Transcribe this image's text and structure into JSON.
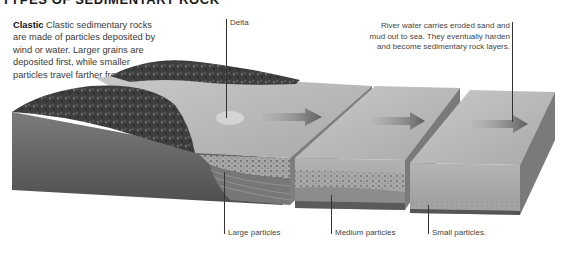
{
  "title": "TYPES OF SEDIMENTARY ROCK",
  "intro": {
    "heading": "Clastic",
    "text": "Clastic sedimentary rocks are made of particles deposited by wind or water. Larger grains are deposited first, while smaller particles travel farther from shore."
  },
  "callouts": {
    "delta": "Delta",
    "river_line1": "River water carries eroded sand and",
    "river_line2": "mud out to sea. They eventually harden",
    "river_line3": "and become sedimentary rock layers.",
    "large": "Large particles",
    "medium": "Medium particles",
    "small": "Small particles."
  },
  "colors": {
    "background": "#ffffff",
    "text": "#3a3a3a",
    "leader": "#333333",
    "terrain_dark": "#3c3c3c",
    "sand_top": "#bdbdbd",
    "slab_side": "#8a8a8a",
    "arrow": "#6a6a6a"
  }
}
